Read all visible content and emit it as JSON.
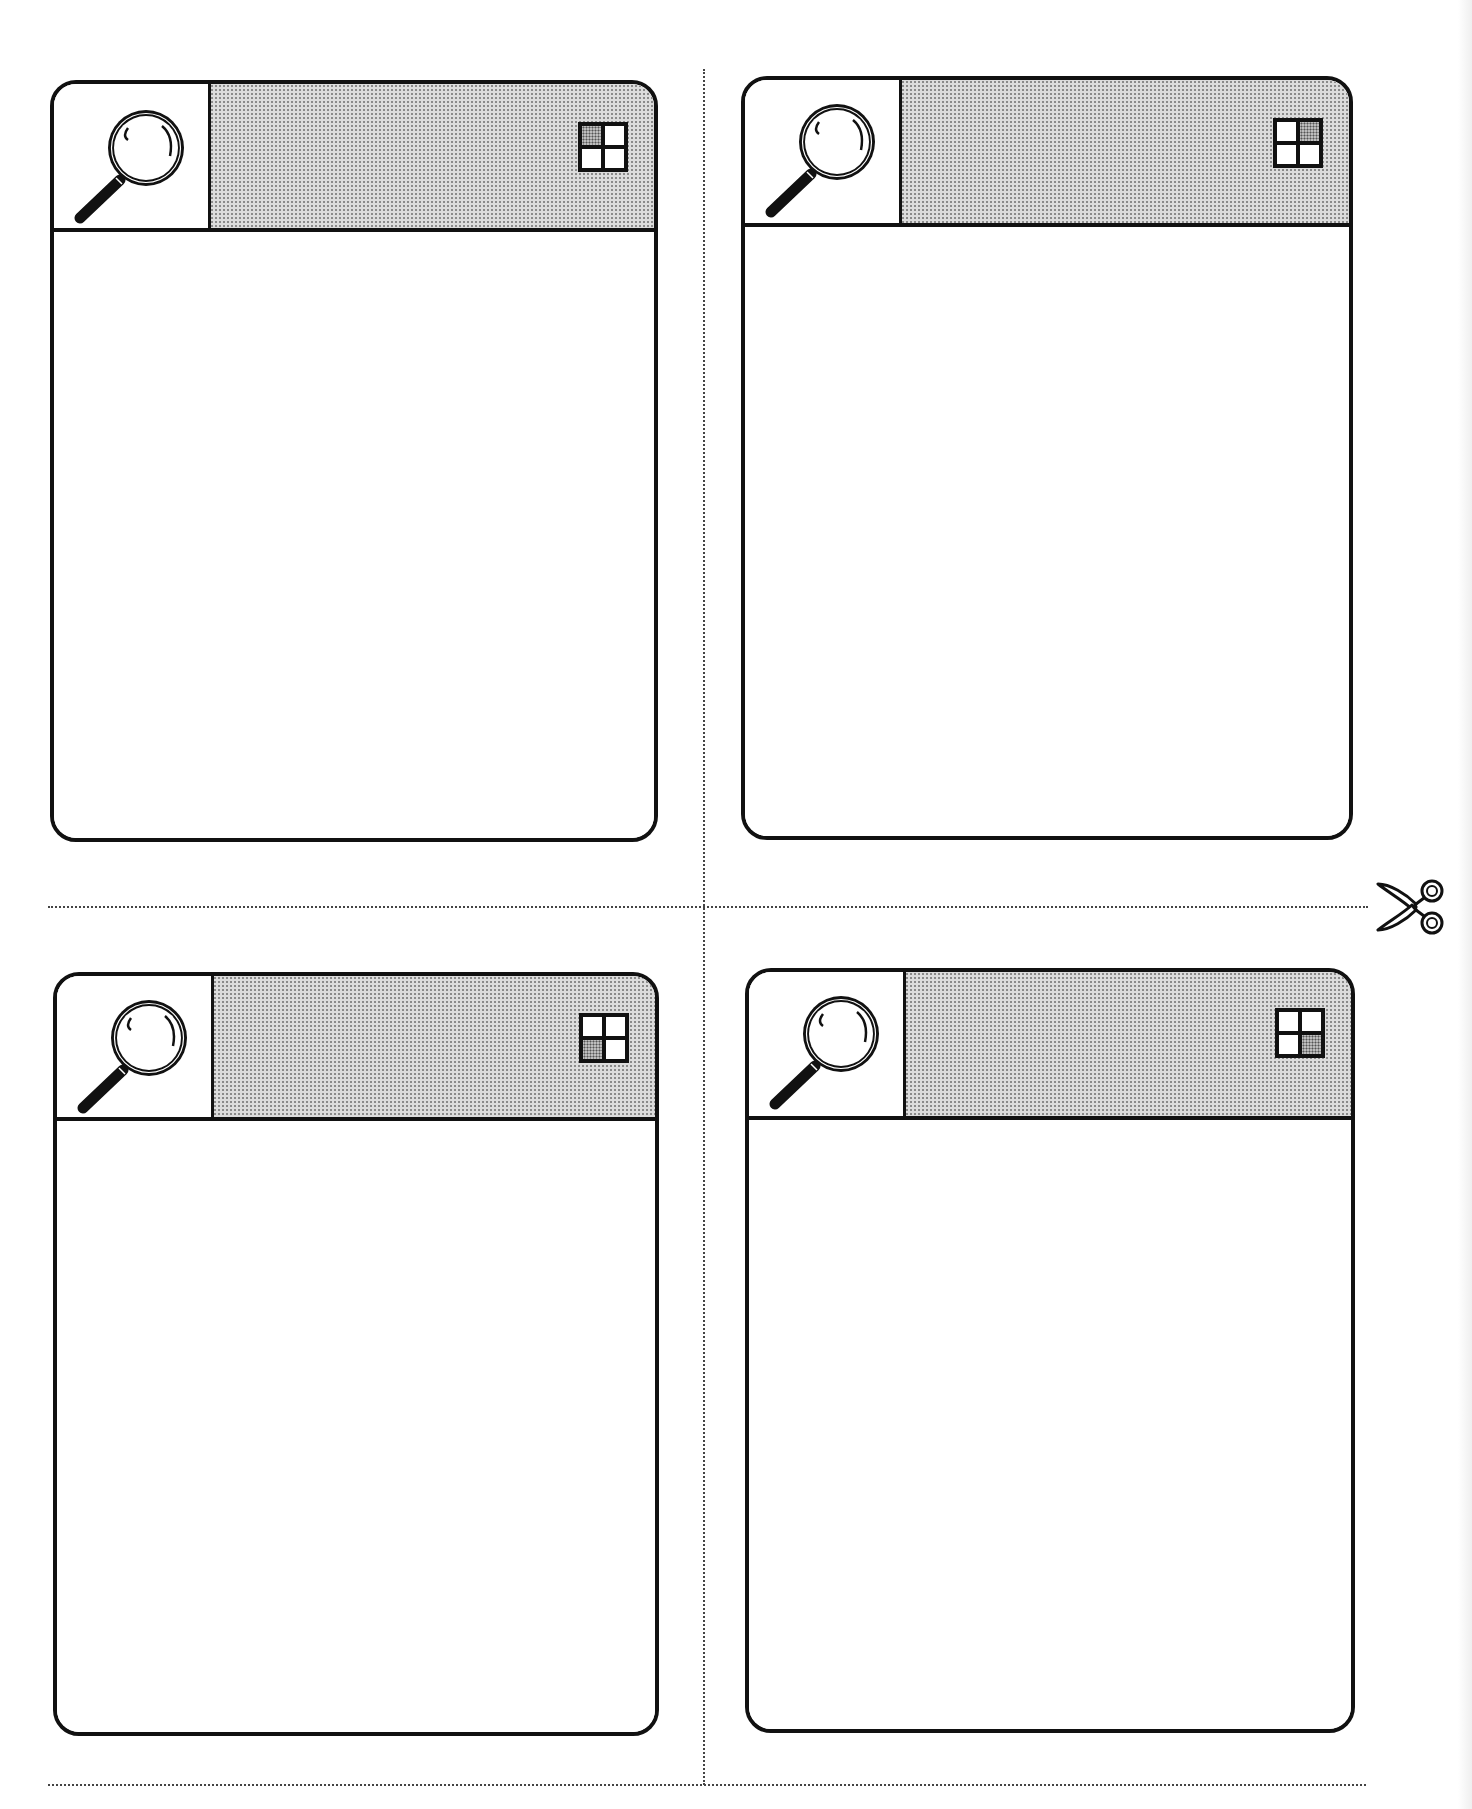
{
  "worksheet": {
    "layout": "2x2 card grid with cut lines",
    "colors": {
      "ink": "#111111",
      "header_fill": "#dcdcdc",
      "paper": "#ffffff",
      "cut_line": "#444444"
    },
    "cards": [
      {
        "position": "top-left",
        "icon": "magnifier-icon",
        "quadrant_icon": "grid-quadrant-icon",
        "highlighted_quadrant": "top-left",
        "body_text": ""
      },
      {
        "position": "top-right",
        "icon": "magnifier-icon",
        "quadrant_icon": "grid-quadrant-icon",
        "highlighted_quadrant": "top-right",
        "body_text": ""
      },
      {
        "position": "bottom-left",
        "icon": "magnifier-icon",
        "quadrant_icon": "grid-quadrant-icon",
        "highlighted_quadrant": "bottom-left",
        "body_text": ""
      },
      {
        "position": "bottom-right",
        "icon": "magnifier-icon",
        "quadrant_icon": "grid-quadrant-icon",
        "highlighted_quadrant": "bottom-right",
        "body_text": ""
      }
    ],
    "cut_marker": "scissors-icon"
  }
}
